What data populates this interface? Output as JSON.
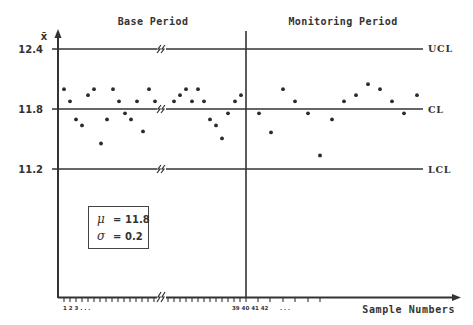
{
  "chart_data": {
    "type": "scatter",
    "subtype": "x-bar control chart",
    "title": "",
    "ylabel": "x̄",
    "xlabel": "Sample Numbers",
    "ylim": [
      11.2,
      12.4
    ],
    "y_ticks": [
      "12.4",
      "11.8",
      "11.2"
    ],
    "periods": [
      {
        "name": "Base Period",
        "samples": "1–40"
      },
      {
        "name": "Monitoring Period",
        "samples": "41–"
      }
    ],
    "control_limits": {
      "UCL": {
        "label": "UCL",
        "value": 12.4
      },
      "CL": {
        "label": "CL",
        "value": 11.8
      },
      "LCL": {
        "label": "LCL",
        "value": 11.2
      }
    },
    "stats_box": {
      "mu_symbol": "μ",
      "mu_value": "11.8",
      "sigma_symbol": "σ",
      "sigma_value": "0.2",
      "equals": "="
    },
    "x_tick_labels": {
      "start": "1 2 3 . . .",
      "divider": "39 40 41 42",
      "after": ". . ."
    },
    "axis_break_symbol": "⟋⟋",
    "series": [
      {
        "name": "Base Period",
        "points": [
          {
            "px": 64,
            "value": 12.0
          },
          {
            "px": 70,
            "value": 11.88
          },
          {
            "px": 76,
            "value": 11.7
          },
          {
            "px": 82,
            "value": 11.64
          },
          {
            "px": 88,
            "value": 11.94
          },
          {
            "px": 94,
            "value": 12.0
          },
          {
            "px": 101,
            "value": 11.46
          },
          {
            "px": 107,
            "value": 11.7
          },
          {
            "px": 113,
            "value": 12.0
          },
          {
            "px": 119,
            "value": 11.88
          },
          {
            "px": 125,
            "value": 11.76
          },
          {
            "px": 131,
            "value": 11.7
          },
          {
            "px": 137,
            "value": 11.88
          },
          {
            "px": 143,
            "value": 11.58
          },
          {
            "px": 149,
            "value": 12.0
          },
          {
            "px": 155,
            "value": 11.88
          },
          {
            "px": 174,
            "value": 11.88
          },
          {
            "px": 180,
            "value": 11.94
          },
          {
            "px": 186,
            "value": 12.0
          },
          {
            "px": 192,
            "value": 11.88
          },
          {
            "px": 198,
            "value": 12.0
          },
          {
            "px": 204,
            "value": 11.88
          },
          {
            "px": 210,
            "value": 11.7
          },
          {
            "px": 216,
            "value": 11.64
          },
          {
            "px": 222,
            "value": 11.51
          },
          {
            "px": 228,
            "value": 11.76
          },
          {
            "px": 235,
            "value": 11.88
          },
          {
            "px": 241,
            "value": 11.94
          }
        ]
      },
      {
        "name": "Monitoring Period",
        "points": [
          {
            "px": 259,
            "value": 11.76
          },
          {
            "px": 271,
            "value": 11.57
          },
          {
            "px": 283,
            "value": 12.0
          },
          {
            "px": 295,
            "value": 11.88
          },
          {
            "px": 308,
            "value": 11.76
          },
          {
            "px": 320,
            "value": 11.34
          },
          {
            "px": 332,
            "value": 11.7
          },
          {
            "px": 344,
            "value": 11.88
          },
          {
            "px": 356,
            "value": 11.94
          },
          {
            "px": 368,
            "value": 12.05
          },
          {
            "px": 380,
            "value": 12.0
          },
          {
            "px": 392,
            "value": 11.88
          },
          {
            "px": 404,
            "value": 11.76
          },
          {
            "px": 417,
            "value": 11.94
          }
        ]
      }
    ]
  }
}
